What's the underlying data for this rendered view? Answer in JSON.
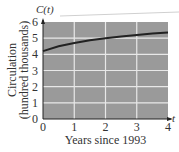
{
  "chart_data": {
    "type": "line",
    "title": "",
    "xlabel": "Years since 1993",
    "ylabel_line1": "Circulation",
    "ylabel_line2": "(hundred thousands)",
    "x_axis_name": "t",
    "y_axis_name": "C(t)",
    "xlim": [
      0,
      4
    ],
    "ylim": [
      0,
      6
    ],
    "x_ticks": [
      "0",
      "1",
      "2",
      "3",
      "4"
    ],
    "y_ticks": [
      "0",
      "1",
      "2",
      "3",
      "4",
      "5",
      "6"
    ],
    "grid": true,
    "series": [
      {
        "name": "C(t)",
        "x": [
          0,
          0.5,
          1,
          1.5,
          2,
          2.5,
          3,
          3.5,
          4
        ],
        "values": [
          4.2,
          4.5,
          4.7,
          4.87,
          5.0,
          5.1,
          5.2,
          5.28,
          5.35
        ]
      }
    ],
    "colors": {
      "plot_bg": "#9a9a9a",
      "grid": "#e8e8e8",
      "line": "#222222"
    }
  }
}
